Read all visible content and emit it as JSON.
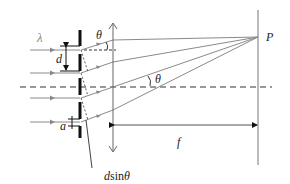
{
  "diagram": {
    "labels": {
      "wavelength": "λ",
      "slit_spacing": "d",
      "slit_width": "a",
      "angle_top": "θ",
      "angle_axis": "θ",
      "focal_length": "f",
      "point": "P",
      "path_difference_var": "d",
      "path_difference_fn": "sin",
      "path_difference_angle": "θ"
    },
    "colors": {
      "ray": "#8a8a8a",
      "grating": "#111111",
      "lens": "#666666",
      "screen": "#777777",
      "axis": "#333333"
    },
    "elements": {
      "incoming_rays": 4,
      "grating_slits": 4,
      "lens": "converging (double-arrow)",
      "screen": "vertical at focal plane"
    }
  }
}
